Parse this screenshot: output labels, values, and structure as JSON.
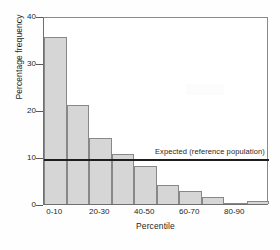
{
  "chart_data": {
    "type": "bar",
    "title": "",
    "xlabel": "Percentile",
    "ylabel": "Percentage frequency",
    "categories": [
      "0-10",
      "10-20",
      "20-30",
      "30-40",
      "40-50",
      "50-60",
      "60-70",
      "70-80",
      "80-90",
      "90-100"
    ],
    "values": [
      35.5,
      21.0,
      14.0,
      10.7,
      8.0,
      4.0,
      2.7,
      1.5,
      0.1,
      0.7
    ],
    "ylim": [
      0,
      40
    ],
    "yticks": [
      0,
      10,
      20,
      30,
      40
    ],
    "ytick_labels": [
      "0",
      "10",
      "20",
      "30",
      "40"
    ],
    "xtick_labels": [
      "0-10",
      "20-30",
      "40-50",
      "60-70",
      "80-90"
    ],
    "xtick_categories": [
      "0-10",
      "20-30",
      "40-50",
      "60-70",
      "80-90"
    ],
    "grid": false,
    "legend": "none",
    "bar_color": "#d6d6d6",
    "bar_edge_color": "#888888",
    "axis_color": "#6f6f6f",
    "reference_line": {
      "label": "Expected (reference population)",
      "value": 10,
      "color": "#1d1d1d"
    }
  }
}
